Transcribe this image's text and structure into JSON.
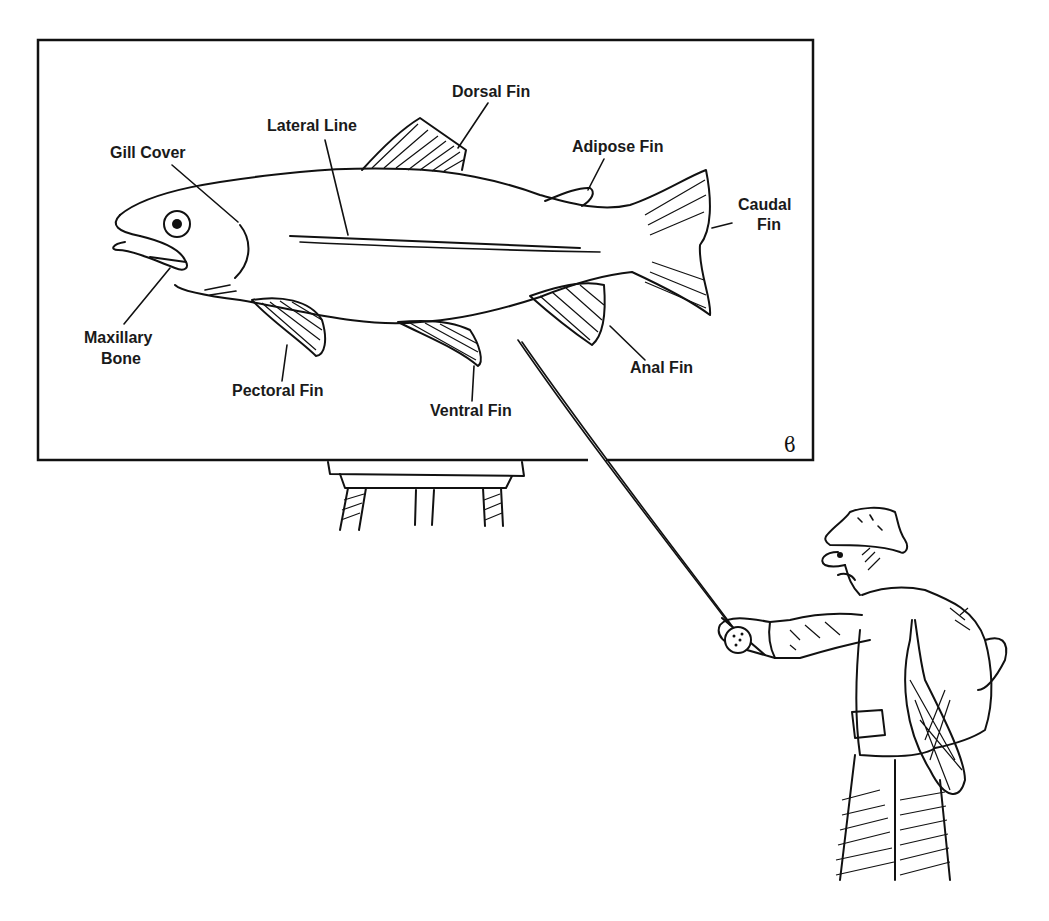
{
  "diagram": {
    "board": {
      "x": 38,
      "y": 40,
      "width": 775,
      "height": 420
    },
    "labels": [
      {
        "id": "gill-cover",
        "lines": [
          "Gill Cover"
        ],
        "x": 150,
        "y": 158
      },
      {
        "id": "lateral-line",
        "lines": [
          "Lateral Line"
        ],
        "x": 316,
        "y": 131
      },
      {
        "id": "dorsal-fin",
        "lines": [
          "Dorsal Fin"
        ],
        "x": 491,
        "y": 97
      },
      {
        "id": "adipose-fin",
        "lines": [
          "Adipose Fin"
        ],
        "x": 621,
        "y": 152
      },
      {
        "id": "caudal-fin",
        "lines": [
          "Caudal",
          "Fin"
        ],
        "x": 756,
        "y": 210
      },
      {
        "id": "maxillary-bone",
        "lines": [
          "Maxillary",
          "Bone"
        ],
        "x": 124,
        "y": 343
      },
      {
        "id": "pectoral-fin",
        "lines": [
          "Pectoral Fin"
        ],
        "x": 281,
        "y": 396
      },
      {
        "id": "ventral-fin",
        "lines": [
          "Ventral Fin"
        ],
        "x": 476,
        "y": 416
      },
      {
        "id": "anal-fin",
        "lines": [
          "Anal Fin"
        ],
        "x": 664,
        "y": 373
      }
    ],
    "signature": "ϐ",
    "colors": {
      "ink": "#111111",
      "background": "#ffffff"
    }
  }
}
